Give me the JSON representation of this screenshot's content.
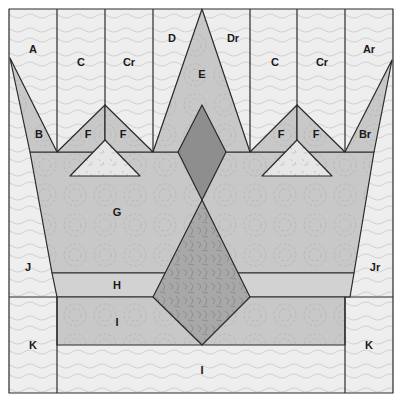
{
  "diagram": {
    "colors": {
      "background_light": "#eeeeee",
      "crown_medium": "#c8c8c8",
      "band_light_medium": "#d2d2d2",
      "diamond_dark": "#8e8e8e",
      "jewel_dark": "#a8a8a8",
      "triangle_light": "#e8e8e8",
      "outline": "#2a2a2a"
    },
    "labels": {
      "A": "A",
      "Ar": "Ar",
      "B": "B",
      "Br": "Br",
      "C_left": "C",
      "Cr_left": "Cr",
      "C_right": "C",
      "Cr_right": "Cr",
      "D": "D",
      "Dr": "Dr",
      "E": "E",
      "F1": "F",
      "F2": "F",
      "F3": "F",
      "F4": "F",
      "G": "G",
      "H": "H",
      "I_upper": "I",
      "I_lower": "I",
      "J": "J",
      "Jr": "Jr",
      "K_left": "K",
      "K_right": "K"
    }
  }
}
